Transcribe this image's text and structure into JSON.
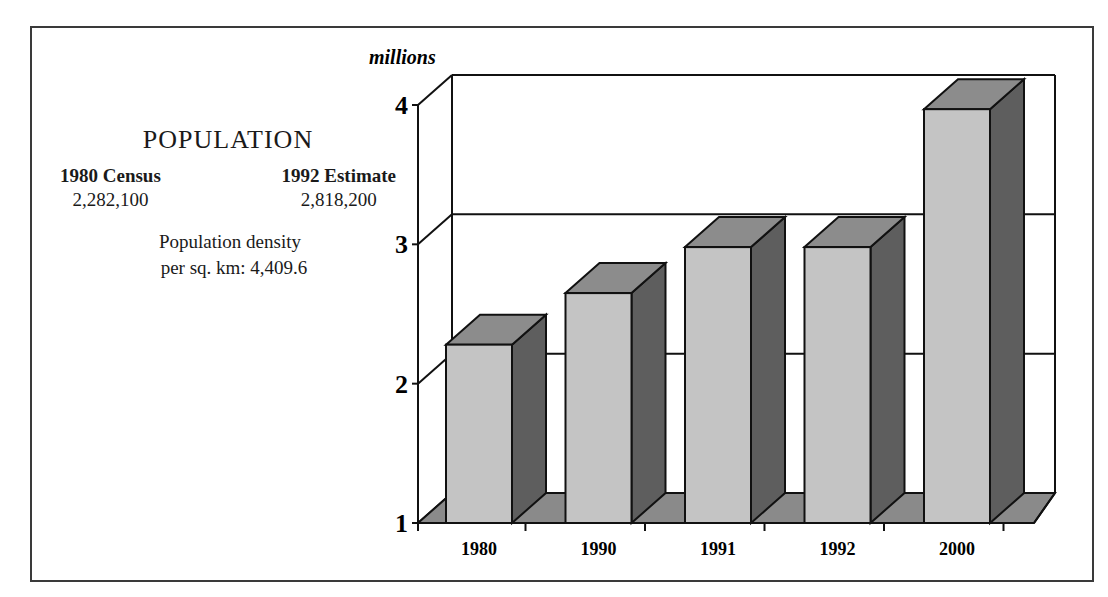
{
  "info": {
    "title": "POPULATION",
    "columns": [
      {
        "heading": "1980 Census",
        "value": "2,282,100"
      },
      {
        "heading": "1992 Estimate",
        "value": "2,818,200"
      }
    ],
    "density_line1": "Population density",
    "density_line2": "per sq. km:  4,409.6"
  },
  "chart_data": {
    "type": "bar",
    "style": "3d-column",
    "title": "POPULATION",
    "ylabel": "millions",
    "xlabel": "",
    "categories": [
      "1980",
      "1990",
      "1991",
      "1992",
      "2000"
    ],
    "values": [
      2.28,
      2.65,
      2.98,
      2.98,
      3.97
    ],
    "ylim": [
      1,
      4
    ],
    "yticks": [
      "1",
      "2",
      "3",
      "4"
    ],
    "grid": true,
    "legend": null,
    "colors": {
      "front": "#c4c4c4",
      "top": "#8c8c8c",
      "side": "#5e5e5e",
      "floor": "#8a8a8a",
      "line": "#111111"
    }
  }
}
